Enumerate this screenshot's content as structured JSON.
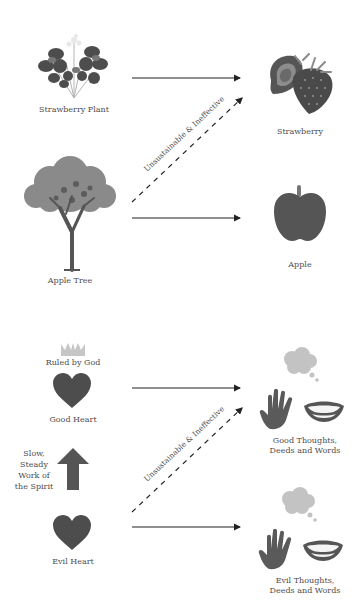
{
  "diagram": {
    "panels": [
      {
        "id": "fruit-analogy",
        "sources": [
          {
            "label": "Strawberry Plant",
            "icon": "strawberry-plant-icon"
          },
          {
            "label": "Apple Tree",
            "icon": "apple-tree-icon"
          }
        ],
        "targets": [
          {
            "label": "Strawberry",
            "icon": "strawberry-icon"
          },
          {
            "label": "Apple",
            "icon": "apple-icon"
          }
        ],
        "dashed_arrow_label": "Unsustainable & Ineffective"
      },
      {
        "id": "heart-analogy",
        "crown_label": "Ruled by God",
        "sources": [
          {
            "label": "Good Heart",
            "icon": "heart-icon"
          },
          {
            "label": "Evil Heart",
            "icon": "heart-icon"
          }
        ],
        "transition_label_lines": [
          "Slow,",
          "Steady",
          "Work of",
          "the Spirit"
        ],
        "targets": [
          {
            "label_lines": [
              "Good Thoughts,",
              "Deeds and Words"
            ],
            "icons": [
              "thought-bubble-icon",
              "hand-icon",
              "mouth-icon"
            ]
          },
          {
            "label_lines": [
              "Evil Thoughts,",
              "Deeds and Words"
            ],
            "icons": [
              "thought-bubble-icon",
              "hand-icon",
              "mouth-icon"
            ]
          }
        ],
        "dashed_arrow_label": "Unsustainable & Ineffective"
      }
    ],
    "colors": {
      "icon_dark": "#555555",
      "icon_mid": "#8a8a8a",
      "icon_light": "#c8c8c8",
      "arrow": "#222222",
      "text": "#4d4d4d"
    }
  }
}
